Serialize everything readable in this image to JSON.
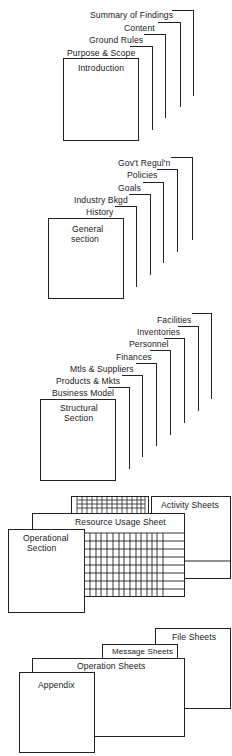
{
  "diagram": {
    "type": "document-structure",
    "sections": [
      {
        "id": "introduction",
        "title": "Introduction",
        "subsections": [
          "Purpose & Scope",
          "Ground Rules",
          "Content",
          "Summary of Findings"
        ]
      },
      {
        "id": "general",
        "title_lines": [
          "General",
          "section"
        ],
        "subsections": [
          "History",
          "Industry  Bkgd",
          "Goals",
          "Policies",
          "Gov't  Regul'n"
        ]
      },
      {
        "id": "structural",
        "title_lines": [
          "Structural",
          "Section"
        ],
        "subsections": [
          "Business Model",
          "Products & Mkts",
          "Mtls & Suppliers",
          "Finances",
          "Personnel",
          "Inventories",
          "Facilities"
        ]
      },
      {
        "id": "operational",
        "title_lines": [
          "Operational",
          "Section"
        ],
        "sheets": [
          "Resource  Usage  Sheet",
          "Activity  Sheets"
        ]
      },
      {
        "id": "appendix",
        "title": "Appendix",
        "sheets": [
          "Operation  Sheets",
          "Message  Sheets",
          "File  Sheets"
        ]
      }
    ]
  }
}
